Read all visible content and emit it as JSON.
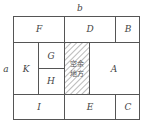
{
  "diagram": {
    "dimension_labels": {
      "width": "b",
      "height": "a"
    },
    "regions": {
      "F": "F",
      "D": "D",
      "B": "B",
      "K": "K",
      "G": "G",
      "H": "H",
      "A": "A",
      "I": "I",
      "E": "E",
      "C": "C"
    },
    "hatched_region": {
      "line1": "空余",
      "line2": "地方"
    },
    "colors": {
      "line": "#555555",
      "background": "#ffffff",
      "text": "#444444"
    }
  }
}
